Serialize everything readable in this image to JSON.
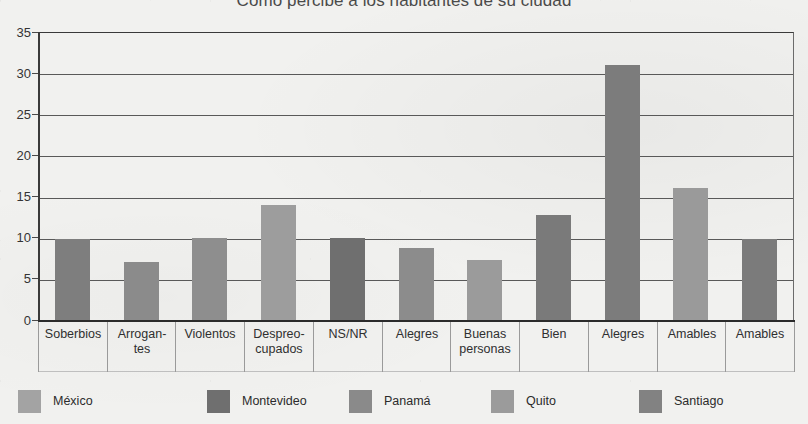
{
  "chart_data": {
    "type": "bar",
    "title": "Cómo percibe a los habitantes de su ciudad",
    "xlabel": "",
    "ylabel": "",
    "ylim": [
      0,
      35
    ],
    "yticks": [
      0,
      5,
      10,
      15,
      20,
      25,
      30,
      35
    ],
    "grid": true,
    "legend_position": "bottom",
    "categories": [
      "Soberbios",
      "Arrogan-\ntes",
      "Violentos",
      "Despreo-\ncupados",
      "NS/NR",
      "Alegres",
      "Buenas\npersonas",
      "Bien",
      "Alegres",
      "Amables",
      "Amables"
    ],
    "values": [
      9.8,
      7.0,
      10.0,
      14.0,
      10.0,
      8.8,
      7.3,
      12.7,
      31.0,
      16.1,
      9.9
    ],
    "bar_colors": [
      "#7e7e7e",
      "#8b8b8b",
      "#8e8e8e",
      "#9d9d9d",
      "#6f6f6f",
      "#8c8c8c",
      "#9b9b9b",
      "#7a7a7a",
      "#7c7c7c",
      "#9a9a9a",
      "#7b7b7b"
    ],
    "legend": [
      {
        "label": "México",
        "color": "#a3a3a3"
      },
      {
        "label": "Montevideo",
        "color": "#6f6f6f"
      },
      {
        "label": "Panamá",
        "color": "#8a8a8a"
      },
      {
        "label": "Quito",
        "color": "#9b9b9b"
      },
      {
        "label": "Santiago",
        "color": "#828282"
      }
    ]
  }
}
